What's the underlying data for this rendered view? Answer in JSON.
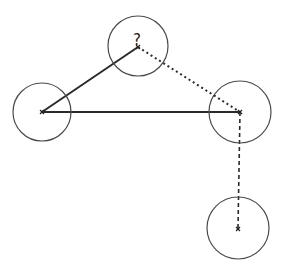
{
  "diagram": {
    "type": "node-graph",
    "nodes": [
      {
        "id": "left",
        "cx": 42,
        "cy": 112,
        "r": 29,
        "label": "",
        "marker": "x"
      },
      {
        "id": "top",
        "cx": 138,
        "cy": 46,
        "r": 30,
        "label": "?",
        "marker": "x"
      },
      {
        "id": "right",
        "cx": 240,
        "cy": 112,
        "r": 31,
        "label": "",
        "marker": "x"
      },
      {
        "id": "bottom",
        "cx": 238,
        "cy": 228,
        "r": 31,
        "label": "",
        "marker": "x"
      }
    ],
    "edges": [
      {
        "from": "left",
        "to": "top",
        "style": "solid"
      },
      {
        "from": "left",
        "to": "right",
        "style": "solid"
      },
      {
        "from": "top",
        "to": "right",
        "style": "dotted"
      },
      {
        "from": "right",
        "to": "bottom",
        "style": "dashed"
      }
    ],
    "colors": {
      "stroke": "#2a2a2a",
      "circle": "#4a4a4a",
      "background": "#ffffff"
    }
  }
}
